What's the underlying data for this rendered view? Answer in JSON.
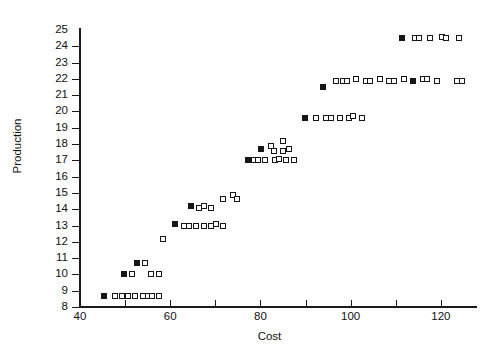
{
  "chart_data": {
    "type": "scatter",
    "title": "",
    "xlabel": "Cost",
    "ylabel": "Production",
    "xlim": [
      40,
      128
    ],
    "ylim": [
      8,
      25
    ],
    "grid": false,
    "legend": null,
    "x_ticks": [
      40,
      60,
      80,
      100,
      120
    ],
    "x_minor_ticks": [
      50,
      70,
      90,
      110
    ],
    "y_ticks": [
      8,
      9,
      10,
      11,
      12,
      13,
      14,
      15,
      16,
      17,
      18,
      19,
      20,
      21,
      22,
      23,
      24,
      25
    ],
    "marker_styles": [
      "open-square",
      "filled-square"
    ],
    "points": [
      {
        "x": 45.3,
        "y": 8.7,
        "fill": "filled"
      },
      {
        "x": 47.8,
        "y": 8.7,
        "fill": "open"
      },
      {
        "x": 49.4,
        "y": 8.7,
        "fill": "open"
      },
      {
        "x": 50.6,
        "y": 8.7,
        "fill": "open"
      },
      {
        "x": 52.3,
        "y": 8.7,
        "fill": "open"
      },
      {
        "x": 53.9,
        "y": 8.7,
        "fill": "open"
      },
      {
        "x": 55.1,
        "y": 8.7,
        "fill": "open"
      },
      {
        "x": 55.9,
        "y": 8.7,
        "fill": "open"
      },
      {
        "x": 57.6,
        "y": 8.7,
        "fill": "open"
      },
      {
        "x": 49.8,
        "y": 10.0,
        "fill": "filled"
      },
      {
        "x": 51.6,
        "y": 10.0,
        "fill": "open"
      },
      {
        "x": 55.8,
        "y": 10.0,
        "fill": "open"
      },
      {
        "x": 57.6,
        "y": 10.0,
        "fill": "open"
      },
      {
        "x": 52.6,
        "y": 10.7,
        "fill": "filled"
      },
      {
        "x": 54.3,
        "y": 10.7,
        "fill": "open"
      },
      {
        "x": 58.3,
        "y": 12.2,
        "fill": "open"
      },
      {
        "x": 61.0,
        "y": 13.1,
        "fill": "filled"
      },
      {
        "x": 63.0,
        "y": 13.0,
        "fill": "open"
      },
      {
        "x": 64.1,
        "y": 13.0,
        "fill": "open"
      },
      {
        "x": 65.8,
        "y": 13.0,
        "fill": "open"
      },
      {
        "x": 67.5,
        "y": 13.0,
        "fill": "open"
      },
      {
        "x": 69.1,
        "y": 13.0,
        "fill": "open"
      },
      {
        "x": 70.1,
        "y": 13.1,
        "fill": "open"
      },
      {
        "x": 71.6,
        "y": 13.0,
        "fill": "open"
      },
      {
        "x": 64.7,
        "y": 14.2,
        "fill": "filled"
      },
      {
        "x": 66.4,
        "y": 14.1,
        "fill": "open"
      },
      {
        "x": 67.4,
        "y": 14.2,
        "fill": "open"
      },
      {
        "x": 69.0,
        "y": 14.1,
        "fill": "open"
      },
      {
        "x": 71.6,
        "y": 14.6,
        "fill": "open"
      },
      {
        "x": 73.9,
        "y": 14.9,
        "fill": "open"
      },
      {
        "x": 74.7,
        "y": 14.6,
        "fill": "open"
      },
      {
        "x": 77.2,
        "y": 17.0,
        "fill": "filled"
      },
      {
        "x": 78.6,
        "y": 17.0,
        "fill": "open"
      },
      {
        "x": 79.5,
        "y": 17.0,
        "fill": "open"
      },
      {
        "x": 81.1,
        "y": 17.0,
        "fill": "open"
      },
      {
        "x": 83.2,
        "y": 17.0,
        "fill": "open"
      },
      {
        "x": 84.1,
        "y": 17.1,
        "fill": "open"
      },
      {
        "x": 85.6,
        "y": 17.0,
        "fill": "open"
      },
      {
        "x": 87.5,
        "y": 17.0,
        "fill": "open"
      },
      {
        "x": 80.1,
        "y": 17.7,
        "fill": "filled"
      },
      {
        "x": 82.3,
        "y": 17.9,
        "fill": "open"
      },
      {
        "x": 83.0,
        "y": 17.6,
        "fill": "open"
      },
      {
        "x": 84.9,
        "y": 18.2,
        "fill": "open"
      },
      {
        "x": 84.9,
        "y": 17.6,
        "fill": "open"
      },
      {
        "x": 86.3,
        "y": 17.7,
        "fill": "open"
      },
      {
        "x": 89.9,
        "y": 19.6,
        "fill": "filled"
      },
      {
        "x": 92.4,
        "y": 19.6,
        "fill": "open"
      },
      {
        "x": 94.6,
        "y": 19.6,
        "fill": "open"
      },
      {
        "x": 95.6,
        "y": 19.6,
        "fill": "open"
      },
      {
        "x": 97.6,
        "y": 19.6,
        "fill": "open"
      },
      {
        "x": 99.7,
        "y": 19.6,
        "fill": "open"
      },
      {
        "x": 100.6,
        "y": 19.7,
        "fill": "open"
      },
      {
        "x": 102.6,
        "y": 19.6,
        "fill": "open"
      },
      {
        "x": 93.9,
        "y": 21.5,
        "fill": "filled"
      },
      {
        "x": 96.7,
        "y": 21.9,
        "fill": "open"
      },
      {
        "x": 98.3,
        "y": 21.9,
        "fill": "open"
      },
      {
        "x": 99.2,
        "y": 21.9,
        "fill": "open"
      },
      {
        "x": 101.2,
        "y": 22.0,
        "fill": "open"
      },
      {
        "x": 103.4,
        "y": 21.9,
        "fill": "open"
      },
      {
        "x": 104.3,
        "y": 21.9,
        "fill": "open"
      },
      {
        "x": 106.5,
        "y": 22.0,
        "fill": "open"
      },
      {
        "x": 108.6,
        "y": 21.9,
        "fill": "open"
      },
      {
        "x": 109.6,
        "y": 21.9,
        "fill": "open"
      },
      {
        "x": 111.8,
        "y": 22.0,
        "fill": "open"
      },
      {
        "x": 113.9,
        "y": 21.9,
        "fill": "filled"
      },
      {
        "x": 116.1,
        "y": 22.0,
        "fill": "open"
      },
      {
        "x": 117.0,
        "y": 22.0,
        "fill": "open"
      },
      {
        "x": 119.2,
        "y": 21.9,
        "fill": "open"
      },
      {
        "x": 123.6,
        "y": 21.9,
        "fill": "open"
      },
      {
        "x": 124.6,
        "y": 21.9,
        "fill": "open"
      },
      {
        "x": 111.3,
        "y": 24.5,
        "fill": "filled"
      },
      {
        "x": 114.3,
        "y": 24.5,
        "fill": "open"
      },
      {
        "x": 115.2,
        "y": 24.5,
        "fill": "open"
      },
      {
        "x": 117.6,
        "y": 24.5,
        "fill": "open"
      },
      {
        "x": 120.3,
        "y": 24.6,
        "fill": "open"
      },
      {
        "x": 121.2,
        "y": 24.5,
        "fill": "open"
      },
      {
        "x": 124.0,
        "y": 24.5,
        "fill": "open"
      }
    ]
  }
}
